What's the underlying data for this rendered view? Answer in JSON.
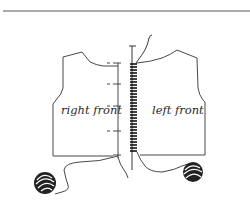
{
  "diagram": {
    "labels": {
      "right_front": "right front",
      "left_front": "left front"
    },
    "colors": {
      "line": "#333333",
      "background": "#ffffff",
      "rule": "#555555"
    },
    "elements": {
      "top_rule": "horizontal-rule",
      "right_front_piece": "garment-piece",
      "left_front_piece": "garment-piece",
      "seam": "whipstitch-seam",
      "yarn_ball_left": "yarn-ball",
      "yarn_ball_right": "yarn-ball",
      "needle": "yarn-needle"
    }
  }
}
